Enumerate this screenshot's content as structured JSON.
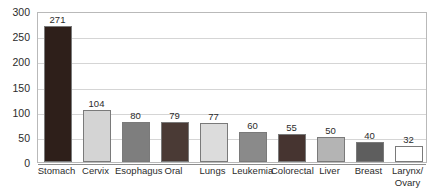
{
  "chart_data": {
    "type": "bar",
    "title": "",
    "subtitle": "",
    "xlabel": "",
    "ylabel": "",
    "ylim": [
      0,
      300
    ],
    "yticks": [
      0,
      50,
      100,
      150,
      200,
      250,
      300
    ],
    "grid": true,
    "legend": null,
    "categories": [
      "Stomach",
      "Cervix",
      "Esophagus",
      "Oral",
      "Lungs",
      "Leukemia",
      "Colorectal",
      "Liver",
      "Breast",
      "Larynx/Ovary"
    ],
    "values": [
      271,
      104,
      80,
      79,
      77,
      60,
      55,
      50,
      40,
      32
    ],
    "bar_colors": [
      "#2e1f1a",
      "#d4d4d4",
      "#7e7e7e",
      "#4a3a35",
      "#dcdcdc",
      "#8a8a8a",
      "#463430",
      "#b4b4b4",
      "#5e5e5e",
      "#ffffff"
    ],
    "bar_border_color": "#7a7a7a",
    "gridline_color": "#d5d5d5",
    "axis_color": "#8d8d8d",
    "plot_border_color": "#b9b9b9",
    "background_color": "#ffffff",
    "text_color": "#2b2b2b"
  },
  "axis": {
    "y_tick_labels": [
      "300",
      "250",
      "200",
      "150",
      "100",
      "50",
      "0"
    ],
    "x_tick_labels": [
      {
        "line1": "Stomach",
        "line2": ""
      },
      {
        "line1": "Cervix",
        "line2": ""
      },
      {
        "line1": "Esophagus",
        "line2": ""
      },
      {
        "line1": "Oral",
        "line2": ""
      },
      {
        "line1": "Lungs",
        "line2": ""
      },
      {
        "line1": "Leukemia",
        "line2": ""
      },
      {
        "line1": "Colorectal",
        "line2": ""
      },
      {
        "line1": "Liver",
        "line2": ""
      },
      {
        "line1": "Breast",
        "line2": ""
      },
      {
        "line1": "Larynx/",
        "line2": "Ovary"
      }
    ]
  },
  "data_labels": [
    "271",
    "104",
    "80",
    "79",
    "77",
    "60",
    "55",
    "50",
    "40",
    "32"
  ]
}
